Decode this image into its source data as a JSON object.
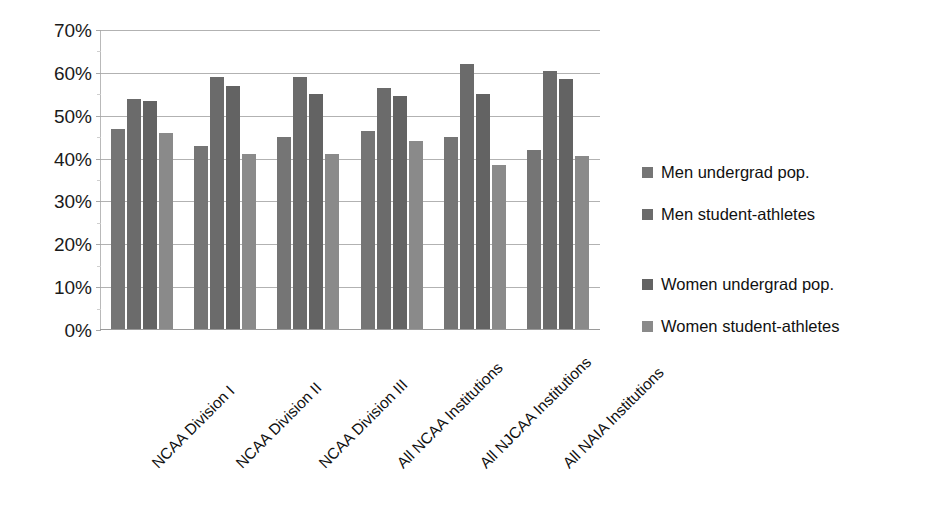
{
  "chart_data": {
    "type": "bar",
    "title": "",
    "subtitle": "",
    "xlabel": "",
    "ylabel": "",
    "ylim": [
      0,
      70
    ],
    "y_tick_labels": [
      "0%",
      "10%",
      "20%",
      "30%",
      "40%",
      "50%",
      "60%",
      "70%"
    ],
    "y_tick_values": [
      0,
      10,
      20,
      30,
      40,
      50,
      60,
      70
    ],
    "grid": true,
    "legend_position": "right",
    "categories": [
      "NCAA Division I",
      "NCAA Division II",
      "NCAA Division III",
      "All NCAA Institutions",
      "All NJCAA Institutions",
      "All NAIA Institutions"
    ],
    "series": [
      {
        "name": "Men undergrad pop.",
        "color": "#757575",
        "values": [
          47,
          43,
          45,
          46.5,
          45,
          42
        ]
      },
      {
        "name": "Men student-athletes",
        "color": "#6b6b6b",
        "values": [
          54,
          59,
          59,
          56.5,
          62,
          60.5
        ]
      },
      {
        "name": "Women undergrad pop.",
        "color": "#636363",
        "values": [
          53.5,
          57,
          55,
          54.5,
          55,
          58.5
        ]
      },
      {
        "name": "Women student-athletes",
        "color": "#8a8a8a",
        "values": [
          46,
          41,
          41,
          44,
          38.5,
          40.5
        ]
      }
    ]
  },
  "legend": {
    "items": [
      {
        "label": "Men undergrad pop.",
        "color": "#757575"
      },
      {
        "label": "Men student-athletes",
        "color": "#6b6b6b"
      },
      {
        "label": "Women undergrad pop.",
        "color": "#636363"
      },
      {
        "label": "Women student-athletes",
        "color": "#8a8a8a"
      }
    ]
  }
}
